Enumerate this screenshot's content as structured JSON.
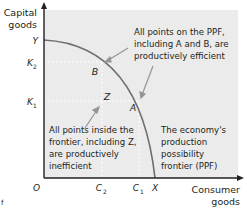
{
  "diagram": {
    "type": "production-possibility-frontier",
    "y_axis_label": [
      "Capital",
      "goods"
    ],
    "x_axis_label": [
      "Consumer",
      "goods"
    ],
    "origin_label": "O",
    "y_ticks": {
      "Y": "Y",
      "K2": "K",
      "K2_sub": "2",
      "K1": "K",
      "K1_sub": "1"
    },
    "x_ticks": {
      "C2": "C",
      "C2_sub": "2",
      "C1": "C",
      "C1_sub": "1",
      "X": "X"
    },
    "points": {
      "A": "A",
      "B": "B",
      "Z": "Z"
    },
    "annotations": {
      "efficient": [
        "All points on the PPF,",
        "including A and B, are",
        "productively efficient"
      ],
      "inefficient": [
        "All points inside the",
        "frontier, including Z,",
        "are productively",
        "inefficient"
      ],
      "ppf": [
        "The economy's",
        "production",
        "possibility",
        "frontier (PPF)"
      ]
    },
    "corner_mark": "f",
    "colors": {
      "plot_bg": "#ebebeb",
      "curve": "#6d6e71",
      "axis": "#231f20",
      "guide": "#ffffff",
      "arrow": "#939598"
    }
  }
}
